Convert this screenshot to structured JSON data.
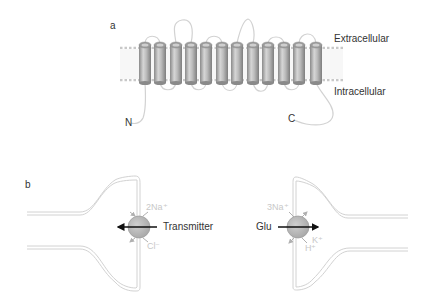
{
  "panel_a": {
    "label": "a",
    "extracellular": "Extracellular",
    "intracellular": "Intracellular",
    "n_terminus": "N",
    "c_terminus": "C",
    "helix_count": 12
  },
  "panel_b": {
    "label": "b",
    "left": {
      "ion_top": "2Na⁺",
      "ion_bottom": "Cl⁻",
      "substrate": "Transmitter"
    },
    "right": {
      "ion_top": "3Na⁺",
      "ion_bottom_k": "K⁺",
      "ion_bottom_h": "H⁺",
      "substrate": "Glu"
    }
  },
  "colors": {
    "cylinder": "#a8a8a8",
    "loop": "#d0d0d0",
    "membrane": "#c8c8c8",
    "transporter": "#b4b4b4",
    "arrow": "#111111",
    "text": "#333333",
    "ion_text": "#c8c8c8"
  }
}
